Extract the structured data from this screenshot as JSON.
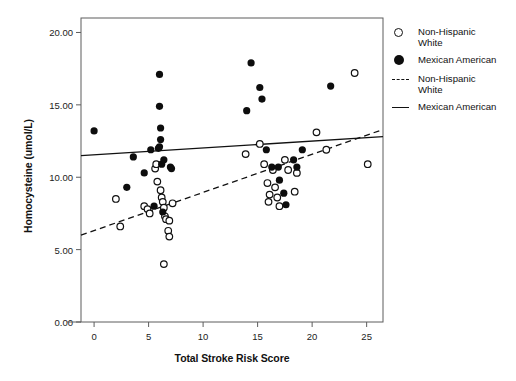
{
  "chart_data": {
    "type": "scatter",
    "title": "",
    "xlabel": "Total Stroke Risk Score",
    "ylabel": "Homocysteine (umol/L)",
    "xlim": [
      -1.2,
      26.5
    ],
    "ylim": [
      0.0,
      21.0
    ],
    "xticks": [
      0,
      5,
      10,
      15,
      20,
      25
    ],
    "xtick_labels": [
      "0",
      "5",
      "10",
      "15",
      "20",
      "25"
    ],
    "yticks": [
      0.0,
      5.0,
      10.0,
      15.0,
      20.0
    ],
    "ytick_labels": [
      "0.00",
      "5.00",
      "10.00",
      "15.00",
      "20.00"
    ],
    "grid": false,
    "legend_position": "right",
    "series": [
      {
        "name": "Non-Hispanic White",
        "marker": "open-circle",
        "color": "#111111",
        "points": [
          [
            2.0,
            8.5
          ],
          [
            2.4,
            6.6
          ],
          [
            4.6,
            8.0
          ],
          [
            4.9,
            7.8
          ],
          [
            5.1,
            7.5
          ],
          [
            5.6,
            10.6
          ],
          [
            5.7,
            10.9
          ],
          [
            5.8,
            9.7
          ],
          [
            6.1,
            9.1
          ],
          [
            6.2,
            8.6
          ],
          [
            6.3,
            8.3
          ],
          [
            6.4,
            7.9
          ],
          [
            6.5,
            7.3
          ],
          [
            6.6,
            7.1
          ],
          [
            6.9,
            7.0
          ],
          [
            7.2,
            8.2
          ],
          [
            6.8,
            6.3
          ],
          [
            6.9,
            5.9
          ],
          [
            6.4,
            4.0
          ],
          [
            13.9,
            11.6
          ],
          [
            15.2,
            12.3
          ],
          [
            15.6,
            10.9
          ],
          [
            15.9,
            9.6
          ],
          [
            16.1,
            8.8
          ],
          [
            16.0,
            8.3
          ],
          [
            16.4,
            10.5
          ],
          [
            16.6,
            9.3
          ],
          [
            16.8,
            8.6
          ],
          [
            17.0,
            8.0
          ],
          [
            17.5,
            11.2
          ],
          [
            17.8,
            10.5
          ],
          [
            18.4,
            9.0
          ],
          [
            18.6,
            10.3
          ],
          [
            20.4,
            13.1
          ],
          [
            21.3,
            11.9
          ],
          [
            23.9,
            17.2
          ],
          [
            25.1,
            10.9
          ]
        ]
      },
      {
        "name": "Mexican American",
        "marker": "filled-circle",
        "color": "#0d0d0d",
        "points": [
          [
            0.0,
            13.2
          ],
          [
            3.0,
            9.3
          ],
          [
            3.6,
            11.4
          ],
          [
            4.6,
            10.3
          ],
          [
            5.2,
            11.9
          ],
          [
            5.5,
            8.0
          ],
          [
            5.9,
            12.0
          ],
          [
            6.0,
            12.1
          ],
          [
            6.0,
            14.9
          ],
          [
            6.0,
            17.1
          ],
          [
            6.1,
            13.4
          ],
          [
            6.1,
            12.6
          ],
          [
            6.2,
            10.9
          ],
          [
            6.3,
            7.6
          ],
          [
            6.4,
            11.2
          ],
          [
            7.0,
            10.7
          ],
          [
            7.1,
            10.6
          ],
          [
            14.0,
            14.6
          ],
          [
            14.4,
            17.9
          ],
          [
            15.2,
            16.2
          ],
          [
            15.4,
            15.4
          ],
          [
            15.8,
            11.9
          ],
          [
            16.3,
            10.7
          ],
          [
            16.9,
            10.7
          ],
          [
            17.0,
            9.8
          ],
          [
            17.4,
            8.9
          ],
          [
            17.6,
            8.1
          ],
          [
            18.3,
            11.2
          ],
          [
            18.6,
            10.7
          ],
          [
            19.1,
            11.9
          ],
          [
            21.7,
            16.3
          ]
        ]
      }
    ],
    "trend_lines": [
      {
        "name": "Non-Hispanic White",
        "style": "dashed",
        "color": "#111111",
        "x_start": -1.2,
        "y_start": 6.0,
        "x_end": 26.5,
        "y_end": 13.3
      },
      {
        "name": "Mexican American",
        "style": "solid",
        "color": "#111111",
        "x_start": -1.2,
        "y_start": 11.5,
        "x_end": 26.5,
        "y_end": 12.8
      }
    ]
  },
  "legend": {
    "items": [
      {
        "label": "Non-Hispanic\nWhite",
        "key": "open-circle-key"
      },
      {
        "label": "Mexican American",
        "key": "filled-circle-key"
      },
      {
        "label": "Non-Hispanic\nWhite",
        "key": "dashed-line-key"
      },
      {
        "label": "Mexican American",
        "key": "solid-line-key"
      }
    ]
  },
  "axes": {
    "x_title": "Total Stroke Risk Score",
    "y_title": "Homocysteine (umol/L)"
  }
}
